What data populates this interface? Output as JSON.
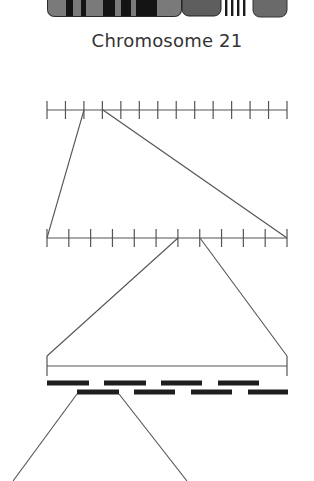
{
  "title": "Chromosome 21",
  "colors": {
    "line": "#555555",
    "band_dark": "#141414",
    "band_gray": "#7a7a7a",
    "band_mid": "#606060",
    "segment": "#1e1e1e",
    "text": "#333333"
  },
  "chromosome": {
    "label": "Chromosome 21",
    "bands": [
      {
        "x0": 47,
        "x1": 66,
        "shade": "gray"
      },
      {
        "x0": 66,
        "x1": 73,
        "shade": "dark"
      },
      {
        "x0": 73,
        "x1": 81,
        "shade": "gray"
      },
      {
        "x0": 81,
        "x1": 86,
        "shade": "dark"
      },
      {
        "x0": 86,
        "x1": 103,
        "shade": "gray"
      },
      {
        "x0": 103,
        "x1": 115,
        "shade": "dark"
      },
      {
        "x0": 115,
        "x1": 121,
        "shade": "gray"
      },
      {
        "x0": 121,
        "x1": 131,
        "shade": "dark"
      },
      {
        "x0": 131,
        "x1": 136,
        "shade": "gray"
      },
      {
        "x0": 136,
        "x1": 157,
        "shade": "dark"
      },
      {
        "x0": 157,
        "x1": 182,
        "shade": "gray"
      }
    ],
    "centromere_block": {
      "x0": 182,
      "x1": 221
    },
    "stalk_lines_x": [
      225,
      231,
      237,
      243
    ],
    "satellite": {
      "x0": 253,
      "x1": 287
    }
  },
  "ruler_1": {
    "y": 110,
    "x0": 47,
    "x1": 287,
    "ticks": 14
  },
  "ruler_2": {
    "y": 238,
    "x0": 47,
    "x1": 287,
    "ticks": 12
  },
  "zoom_lines": [
    {
      "from": [
        84,
        110
      ],
      "to": [
        47,
        238
      ]
    },
    {
      "from": [
        103,
        110
      ],
      "to": [
        287,
        238
      ]
    },
    {
      "from": [
        178,
        238
      ],
      "to": [
        47,
        356
      ]
    },
    {
      "from": [
        200,
        238
      ],
      "to": [
        287,
        356
      ]
    },
    {
      "from": [
        77,
        394
      ],
      "to": [
        13,
        481
      ]
    },
    {
      "from": [
        119,
        394
      ],
      "to": [
        187,
        481
      ]
    }
  ],
  "bracket": {
    "x0": 47,
    "x1": 287,
    "y_top": 356,
    "y_bar": 366,
    "y_bottom": 376
  },
  "overlap_segments": {
    "top_row": {
      "y": 383,
      "spans": [
        [
          47,
          89
        ],
        [
          104,
          146
        ],
        [
          161,
          202
        ],
        [
          218,
          259
        ]
      ]
    },
    "bottom_row": {
      "y": 392,
      "spans": [
        [
          77,
          119
        ],
        [
          134,
          175
        ],
        [
          191,
          232
        ],
        [
          248,
          288
        ]
      ]
    },
    "height": 5
  }
}
